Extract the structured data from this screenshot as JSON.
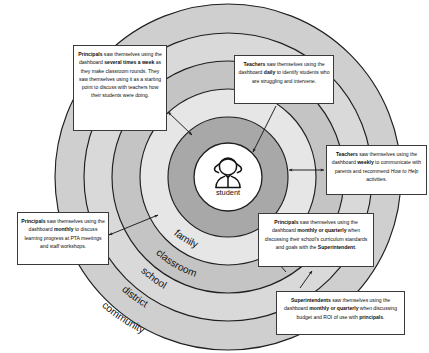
{
  "diagram": {
    "center": {
      "icon": "student-person-icon",
      "label": "student"
    },
    "rings": [
      {
        "name": "family",
        "label": "family",
        "fill": "#a8a8a8"
      },
      {
        "name": "classroom",
        "label": "classroom",
        "fill": "#e6e6e6"
      },
      {
        "name": "school",
        "label": "school",
        "fill": "#c4c4c4"
      },
      {
        "name": "district",
        "label": "district",
        "fill": "#d9d9d9"
      },
      {
        "name": "community",
        "label": "community",
        "fill": "#cfcfcf"
      }
    ],
    "colors": {
      "stroke": "#1f1f1f",
      "background": "#ffffff",
      "callout_border": "#3a3a3a",
      "callout_fill": "#ffffff"
    },
    "callouts": [
      {
        "id": "principals-several-times-a-week",
        "role": "Principals",
        "segments": [
          {
            "text": "Principals",
            "bold": true
          },
          {
            "text": " saw themselves using the dashboard ",
            "bold": false
          },
          {
            "text": "several times a week",
            "bold": true
          },
          {
            "text": " as they make classroom rounds. They saw themselves using it as a starting point to discuss with teachers how their students were doing.",
            "bold": false
          }
        ],
        "plain": "Principals saw themselves using the dashboard several times a week as they make classroom rounds. They saw themselves using it as a starting point to discuss with teachers how their students were doing."
      },
      {
        "id": "teachers-daily",
        "role": "Teachers",
        "segments": [
          {
            "text": "Teachers",
            "bold": true
          },
          {
            "text": " saw themselves using the dashboard ",
            "bold": false
          },
          {
            "text": "daily",
            "bold": true
          },
          {
            "text": " to identify students who are struggling and intervene.",
            "bold": false
          }
        ],
        "plain": "Teachers saw themselves using the dashboard daily to identify students who are struggling and intervene."
      },
      {
        "id": "teachers-weekly",
        "role": "Teachers",
        "segments": [
          {
            "text": "Teachers",
            "bold": true
          },
          {
            "text": " saw themselves using the dashboard ",
            "bold": false
          },
          {
            "text": "weekly",
            "bold": true
          },
          {
            "text": " to communicate with parents and recommend ",
            "bold": false
          },
          {
            "text": "How to Help",
            "italic": true
          },
          {
            "text": " activities.",
            "bold": false
          }
        ],
        "plain": "Teachers saw themselves using the dashboard weekly to communicate with parents and recommend How to Help activities."
      },
      {
        "id": "principals-monthly",
        "role": "Principals",
        "segments": [
          {
            "text": "Principals",
            "bold": true
          },
          {
            "text": " saw themselves using the dashboard ",
            "bold": false
          },
          {
            "text": "monthly",
            "bold": true
          },
          {
            "text": " to discuss learning progress at PTA meetings and staff workshops.",
            "bold": false
          }
        ],
        "plain": "Principals saw themselves using the dashboard monthly to discuss learning progress at PTA meetings and staff workshops."
      },
      {
        "id": "principals-monthly-or-quarterly",
        "role": "Principals",
        "segments": [
          {
            "text": "Principals",
            "bold": true
          },
          {
            "text": " saw themselves using the dashboard ",
            "bold": false
          },
          {
            "text": "monthly or quarterly",
            "bold": true
          },
          {
            "text": " when discussing their school's curriculum standards and goals with the ",
            "bold": false
          },
          {
            "text": "Superintendent",
            "bold": true
          },
          {
            "text": ".",
            "bold": false
          }
        ],
        "plain": "Principals saw themselves using the dashboard monthly or quarterly when discussing their school's curriculum standards and goals with the Superintendent."
      },
      {
        "id": "superintendents-monthly-or-quarterly",
        "role": "Superintendents",
        "segments": [
          {
            "text": "Superintendents",
            "bold": true
          },
          {
            "text": " saw themselves using the dashboard ",
            "bold": false
          },
          {
            "text": "monthly or quarterly",
            "bold": true
          },
          {
            "text": " when discussing budget and ROI of use with ",
            "bold": false
          },
          {
            "text": "principals",
            "bold": true
          },
          {
            "text": ".",
            "bold": false
          }
        ],
        "plain": "Superintendents saw themselves using the dashboard monthly or quarterly when discussing budget and ROI of use with principals."
      }
    ]
  }
}
